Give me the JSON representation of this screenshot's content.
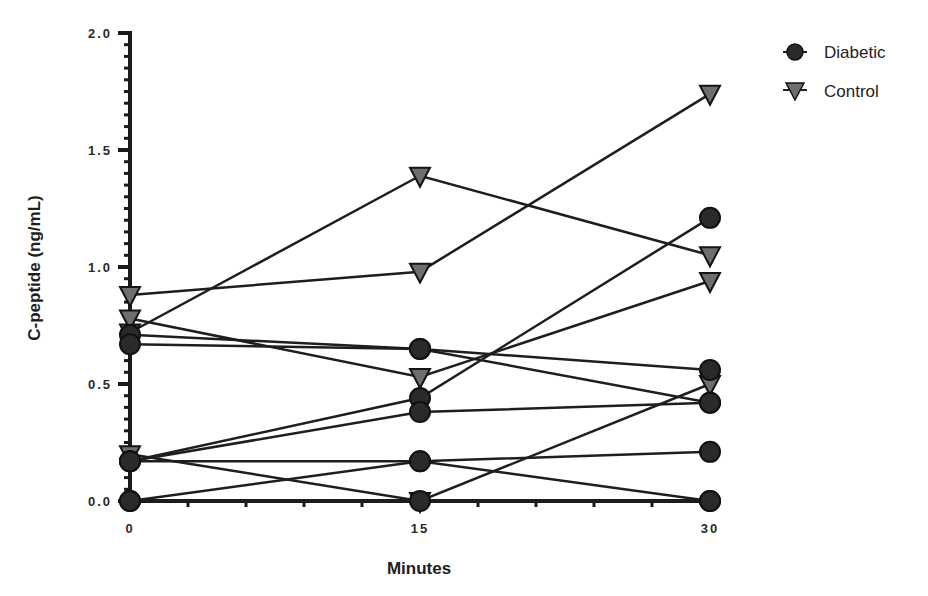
{
  "chart_data": {
    "type": "line",
    "title": "",
    "xlabel": "Minutes",
    "ylabel": "C-peptide (ng/mL)",
    "x": [
      0,
      15,
      30
    ],
    "x_ticks": [
      "0",
      "15",
      "30"
    ],
    "y_ticks": [
      "0.0",
      "0.5",
      "1.0",
      "1.5",
      "2.0"
    ],
    "ylim": [
      0,
      2.0
    ],
    "grid": false,
    "legend_position": "top-right",
    "legend": [
      {
        "name": "Diabetic",
        "marker": "circle",
        "color": "#2a2a2a"
      },
      {
        "name": "Control",
        "marker": "triangle-down",
        "color": "#6e6e6e"
      }
    ],
    "series": [
      {
        "name": "Diabetic",
        "group": "Diabetic",
        "values": [
          0.71,
          0.65,
          0.56
        ]
      },
      {
        "name": "Diabetic",
        "group": "Diabetic",
        "values": [
          0.67,
          0.65,
          0.42
        ]
      },
      {
        "name": "Diabetic",
        "group": "Diabetic",
        "values": [
          0.17,
          0.44,
          1.21
        ]
      },
      {
        "name": "Diabetic",
        "group": "Diabetic",
        "values": [
          0.17,
          0.38,
          0.42
        ]
      },
      {
        "name": "Diabetic",
        "group": "Diabetic",
        "values": [
          0.17,
          0.17,
          0.21
        ]
      },
      {
        "name": "Diabetic",
        "group": "Diabetic",
        "values": [
          0.0,
          0.17,
          0.0
        ]
      },
      {
        "name": "Diabetic",
        "group": "Diabetic",
        "values": [
          0.0,
          0.0,
          0.0
        ]
      },
      {
        "name": "Control",
        "group": "Control",
        "values": [
          0.88,
          0.98,
          1.74
        ]
      },
      {
        "name": "Control",
        "group": "Control",
        "values": [
          0.72,
          1.39,
          1.05
        ]
      },
      {
        "name": "Control",
        "group": "Control",
        "values": [
          0.78,
          0.53,
          0.94
        ]
      },
      {
        "name": "Control",
        "group": "Control",
        "values": [
          0.2,
          0.0,
          0.5
        ]
      }
    ]
  },
  "labels": {
    "xlabel": "Minutes",
    "ylabel": "C-peptide (ng/mL)",
    "legend_diabetic": "Diabetic",
    "legend_control": "Control"
  }
}
